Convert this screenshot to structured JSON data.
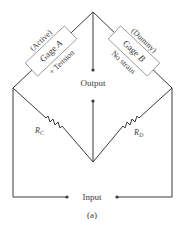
{
  "diagram": {
    "caption": "(a)",
    "gage_a": {
      "role": "(Active)",
      "name": "Gage A",
      "name_prefix": "Gage ",
      "name_letter": "A",
      "condition": "+ Tension"
    },
    "gage_b": {
      "role": "(Dummy)",
      "name": "Gage B",
      "name_prefix": "Gage ",
      "name_letter": "B",
      "condition": "No strain"
    },
    "resistor_c": {
      "label": "R",
      "subscript": "C"
    },
    "resistor_d": {
      "label": "R",
      "subscript": "D"
    },
    "output_label": "Output",
    "input_label": "Input",
    "colors": {
      "wire": "#3a3a3a",
      "box_border": "#8a8a8a",
      "background": "#ffffff"
    }
  }
}
